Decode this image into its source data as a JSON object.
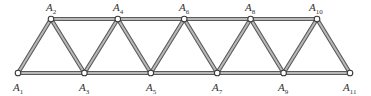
{
  "diagram": {
    "type": "Warren truss",
    "nodes": [
      {
        "id": "A1",
        "label": "A",
        "sub": "1",
        "x": 18,
        "y": 73,
        "lx": 13,
        "ly": 91,
        "pos": "bottom"
      },
      {
        "id": "A2",
        "label": "A",
        "sub": "2",
        "x": 51,
        "y": 19,
        "lx": 46,
        "ly": 11,
        "pos": "top"
      },
      {
        "id": "A3",
        "label": "A",
        "sub": "3",
        "x": 84.4,
        "y": 73,
        "lx": 79,
        "ly": 91,
        "pos": "bottom"
      },
      {
        "id": "A4",
        "label": "A",
        "sub": "4",
        "x": 117.8,
        "y": 19,
        "lx": 113,
        "ly": 11,
        "pos": "top"
      },
      {
        "id": "A5",
        "label": "A",
        "sub": "5",
        "x": 150.8,
        "y": 73,
        "lx": 146,
        "ly": 91,
        "pos": "bottom"
      },
      {
        "id": "A6",
        "label": "A",
        "sub": "6",
        "x": 184.2,
        "y": 19,
        "lx": 179,
        "ly": 11,
        "pos": "top"
      },
      {
        "id": "A7",
        "label": "A",
        "sub": "7",
        "x": 217.2,
        "y": 73,
        "lx": 212,
        "ly": 91,
        "pos": "bottom"
      },
      {
        "id": "A8",
        "label": "A",
        "sub": "8",
        "x": 250.6,
        "y": 19,
        "lx": 245,
        "ly": 11,
        "pos": "top"
      },
      {
        "id": "A9",
        "label": "A",
        "sub": "9",
        "x": 283.6,
        "y": 73,
        "lx": 278,
        "ly": 91,
        "pos": "bottom"
      },
      {
        "id": "A10",
        "label": "A",
        "sub": "10",
        "x": 317,
        "y": 19,
        "lx": 309,
        "ly": 11,
        "pos": "top"
      },
      {
        "id": "A11",
        "label": "A",
        "sub": "11",
        "x": 350,
        "y": 73,
        "lx": 343,
        "ly": 91,
        "pos": "bottom"
      }
    ],
    "members": [
      [
        "A1",
        "A3"
      ],
      [
        "A3",
        "A5"
      ],
      [
        "A5",
        "A7"
      ],
      [
        "A7",
        "A9"
      ],
      [
        "A9",
        "A11"
      ],
      [
        "A2",
        "A4"
      ],
      [
        "A4",
        "A6"
      ],
      [
        "A6",
        "A8"
      ],
      [
        "A8",
        "A10"
      ],
      [
        "A1",
        "A2"
      ],
      [
        "A2",
        "A3"
      ],
      [
        "A3",
        "A4"
      ],
      [
        "A4",
        "A5"
      ],
      [
        "A5",
        "A6"
      ],
      [
        "A6",
        "A7"
      ],
      [
        "A7",
        "A8"
      ],
      [
        "A8",
        "A9"
      ],
      [
        "A9",
        "A10"
      ],
      [
        "A10",
        "A11"
      ]
    ],
    "colors": {
      "member_edge": "#5a5a5a",
      "member_fill": "#b8b8b8",
      "node_fill": "#ffffff",
      "node_stroke": "#3a3a3a",
      "label": "#333333"
    }
  }
}
